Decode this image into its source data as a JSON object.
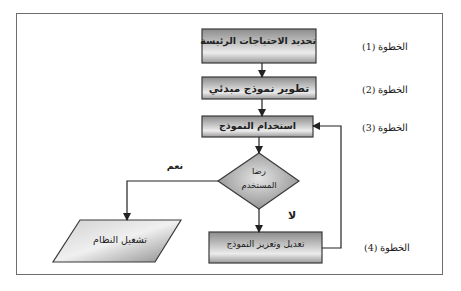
{
  "diagram": {
    "type": "flowchart",
    "direction": "rtl",
    "steps": [
      {
        "id": "step1",
        "label": "الخطوة (1)"
      },
      {
        "id": "step2",
        "label": "الخطوة (2)"
      },
      {
        "id": "step3",
        "label": "الخطوة (3)"
      },
      {
        "id": "step4",
        "label": "الخطوة (4)"
      }
    ],
    "nodes": {
      "identify_needs": {
        "shape": "rectangle",
        "label": "تحديد الاحتياجات الرئيسة"
      },
      "develop_prototype": {
        "shape": "rectangle",
        "label": "تطوير نموذج مبدئي"
      },
      "use_prototype": {
        "shape": "rectangle",
        "label": "استخدام النموذج"
      },
      "user_satisfaction": {
        "shape": "diamond",
        "label_line1": "رضا",
        "label_line2": "المستخدم"
      },
      "modify_prototype": {
        "shape": "rectangle",
        "label": "تعديل وتعزيز النموذج"
      },
      "run_system": {
        "shape": "parallelogram",
        "label": "تشغيل النظام"
      }
    },
    "edges": [
      {
        "from": "identify_needs",
        "to": "develop_prototype",
        "label": ""
      },
      {
        "from": "develop_prototype",
        "to": "use_prototype",
        "label": ""
      },
      {
        "from": "use_prototype",
        "to": "user_satisfaction",
        "label": ""
      },
      {
        "from": "user_satisfaction",
        "to": "run_system",
        "label": "نعم"
      },
      {
        "from": "user_satisfaction",
        "to": "modify_prototype",
        "label": "لا"
      },
      {
        "from": "modify_prototype",
        "to": "use_prototype",
        "label": ""
      }
    ],
    "edge_labels": {
      "yes": "نعم",
      "no": "لا"
    },
    "colors": {
      "box_fill_light": "#e6e6e6",
      "box_fill_dark": "#8a8a8a",
      "stroke": "#3a3a3a",
      "frame": "#6e6e6e"
    }
  }
}
